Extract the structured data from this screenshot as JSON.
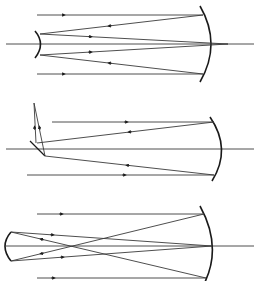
{
  "diagram": {
    "type": "telescope-ray-diagrams",
    "colors": {
      "line": "#3a3a3a",
      "mirror": "#1a1a1a",
      "background": "#ffffff"
    },
    "panels": [
      {
        "name": "cassegrain",
        "secondary": "convex",
        "axis_y": 44
      },
      {
        "name": "newtonian",
        "secondary": "flat-diagonal",
        "axis_y": 149
      },
      {
        "name": "gregorian",
        "secondary": "concave",
        "axis_y": 246
      }
    ]
  }
}
